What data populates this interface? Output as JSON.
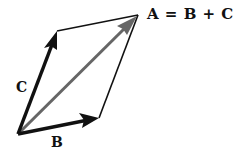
{
  "diagram": {
    "equation_label": "A = B + C",
    "vectors": [
      {
        "name": "B",
        "label": "B",
        "color": "#111111",
        "from": [
          18,
          134
        ],
        "to": [
          99,
          118
        ]
      },
      {
        "name": "C",
        "label": "C",
        "color": "#111111",
        "from": [
          18,
          134
        ],
        "to": [
          57,
          31
        ]
      },
      {
        "name": "A",
        "label": "A",
        "color": "#666666",
        "from": [
          18,
          134
        ],
        "to": [
          137,
          16
        ]
      }
    ],
    "parallelogram": {
      "vertices": [
        [
          18,
          134
        ],
        [
          99,
          118
        ],
        [
          138,
          15
        ],
        [
          57,
          31
        ]
      ],
      "edge_color": "#111111"
    },
    "labels": {
      "b": "B",
      "c": "C"
    }
  }
}
